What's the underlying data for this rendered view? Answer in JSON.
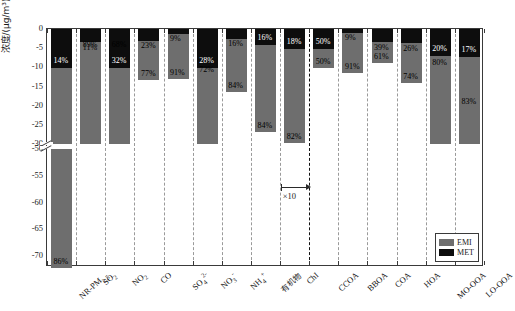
{
  "chart_data": {
    "type": "bar",
    "title": "",
    "xlabel": "",
    "ylabel": "浓度/(μg/m³)",
    "stacked": true,
    "orientation": "downward-negative",
    "ylim": [
      -72,
      0
    ],
    "axis_break": {
      "from": -30,
      "to": -50,
      "label": "axis-break"
    },
    "ytick_labels": [
      "0",
      "-5",
      "-10",
      "-15",
      "-20",
      "-25",
      "-30",
      "-50",
      "-55",
      "-60",
      "-65",
      "-70"
    ],
    "ytick_values": [
      0,
      -5,
      -10,
      -15,
      -20,
      -25,
      -30,
      -50,
      -55,
      -60,
      -65,
      -70
    ],
    "grid": false,
    "legend_position": "bottom-right",
    "legend": [
      {
        "name": "EMI",
        "color": "#6e6e6e"
      },
      {
        "name": "MET",
        "color": "#0d0d0d"
      }
    ],
    "annotations": [
      {
        "text": "×10",
        "note": "CbI bar scaled by factor of ten, arrow marker"
      }
    ],
    "categories": [
      "NR-PM2.5",
      "SO2",
      "NO2",
      "CO",
      "SO4^2-",
      "NO3^-",
      "NH4^+",
      "有机物",
      "ChI",
      "CCOA",
      "BBOA",
      "COA",
      "HOA",
      "MO-OOA",
      "LO-OOA"
    ],
    "category_labels_html": [
      "NR-PM<sub>2.5</sub>",
      "SO<sub>2</sub>",
      "NO<sub>2</sub>",
      "CO",
      "SO<sub>4</sub><sup>2-</sup>",
      "NO<sub>3</sub><sup>-</sup>",
      "NH<sub>4</sub><sup>+</sup>",
      "有机物",
      "ChI",
      "CCOA",
      "BBOA",
      "COA",
      "HOA",
      "MO-OOA",
      "LO-OOA"
    ],
    "series": [
      {
        "name": "EMI",
        "color": "#6e6e6e",
        "values": [
          -62.0,
          -28.3,
          -21.6,
          -10.3,
          -11.9,
          -26.1,
          -13.8,
          -22.5,
          -24.4,
          -5.1,
          -10.6,
          -5.4,
          -10.5,
          -28.0,
          -35.1
        ]
      },
      {
        "name": "MET",
        "color": "#0d0d0d",
        "values": [
          -10.1,
          -3.5,
          -10.2,
          -3.1,
          -1.2,
          -10.2,
          -2.6,
          -4.3,
          -5.3,
          -5.1,
          -1.0,
          -3.5,
          -3.7,
          -7.0,
          -7.2
        ]
      }
    ],
    "percent_labels": {
      "EMI": [
        "86%",
        "89%",
        "68%",
        "77%",
        "91%",
        "72%",
        "84%",
        "84%",
        "82%",
        "50%",
        "91%",
        "61%",
        "74%",
        "80%",
        "83%"
      ],
      "MET": [
        "14%",
        "11%",
        "32%",
        "23%",
        "9%",
        "28%",
        "16%",
        "16%",
        "18%",
        "50%",
        "9%",
        "39%",
        "26%",
        "20%",
        "17%"
      ]
    }
  },
  "legend": {
    "emi_label": "EMI",
    "met_label": "MET"
  },
  "axis": {
    "y_label": "浓度/(μg/m³)",
    "t0": "0",
    "t1": "-5",
    "t2": "-10",
    "t3": "-15",
    "t4": "-20",
    "t5": "-25",
    "t6": "-30",
    "t7": "-50",
    "t8": "-55",
    "t9": "-60",
    "t10": "-65",
    "t11": "-70"
  },
  "annotation": {
    "x10": "×10"
  },
  "cats": {
    "c0": "NR-PM",
    "c0s": "2.5",
    "c1": "SO",
    "c1s": "2",
    "c2": "NO",
    "c2s": "2",
    "c3": "CO",
    "c4": "SO",
    "c4s": "4",
    "c4p": "2-",
    "c5": "NO",
    "c5s": "3",
    "c5p": "-",
    "c6": "NH",
    "c6s": "4",
    "c6p": "+",
    "c7": "有机物",
    "c8": "ChI",
    "c9": "CCOA",
    "c10": "BBOA",
    "c11": "COA",
    "c12": "HOA",
    "c13": "MO-OOA",
    "c14": "LO-OOA"
  },
  "pct": {
    "emi": [
      "86%",
      "89%",
      "68%",
      "77%",
      "91%",
      "72%",
      "84%",
      "84%",
      "82%",
      "50%",
      "91%",
      "61%",
      "74%",
      "80%",
      "83%"
    ],
    "met": [
      "14%",
      "11%",
      "32%",
      "23%",
      "9%",
      "28%",
      "16%",
      "16%",
      "18%",
      "50%",
      "9%",
      "39%",
      "26%",
      "20%",
      "17%"
    ]
  }
}
